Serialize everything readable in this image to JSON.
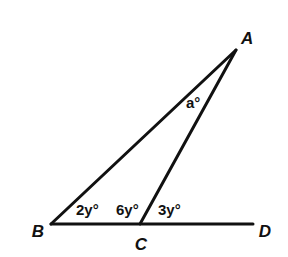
{
  "diagram": {
    "type": "triangle-with-exterior-angle",
    "points": {
      "A": {
        "label": "A",
        "x": 236,
        "y": 50,
        "lx": 241,
        "ly": 44
      },
      "B": {
        "label": "B",
        "x": 51,
        "y": 224,
        "lx": 38,
        "ly": 237
      },
      "C": {
        "label": "C",
        "x": 140,
        "y": 224,
        "lx": 141,
        "ly": 250
      },
      "D": {
        "label": "D",
        "x": 253,
        "y": 224,
        "lx": 265,
        "ly": 237
      }
    },
    "segments": [
      {
        "from": "A",
        "to": "B"
      },
      {
        "from": "A",
        "to": "C"
      },
      {
        "from": "B",
        "to": "D"
      }
    ],
    "angle_labels": {
      "a": {
        "text": "a°",
        "x": 186,
        "y": 108
      },
      "angle_B": {
        "text": "2y°",
        "x": 76,
        "y": 215
      },
      "angle_ACB": {
        "text": "6y°",
        "x": 116,
        "y": 215
      },
      "angle_ACD": {
        "text": "3y°",
        "x": 158,
        "y": 215
      }
    },
    "colors": {
      "ink": "#111111",
      "background": "#ffffff"
    }
  }
}
